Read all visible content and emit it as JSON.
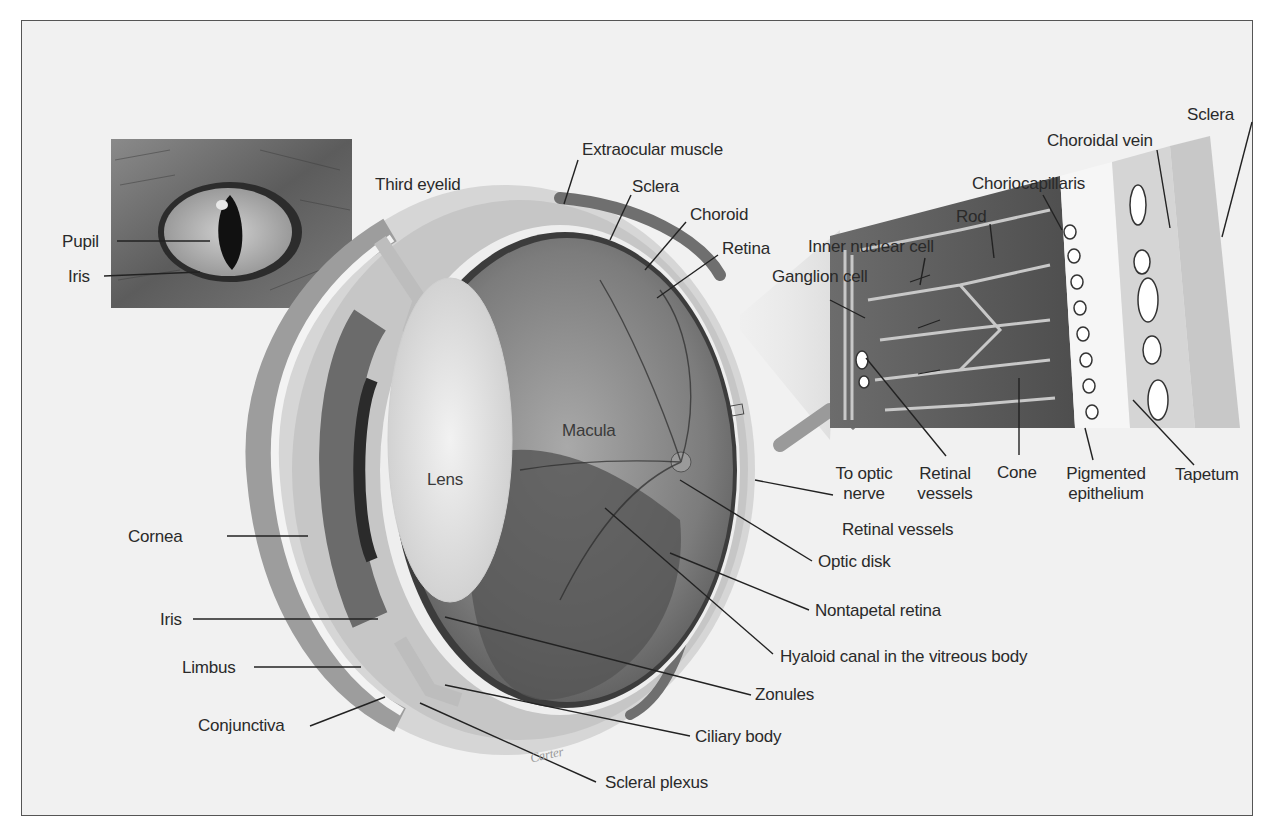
{
  "figure": {
    "inset_photo": {
      "description": "Close-up photograph of a cat eye with slit pupil",
      "labels": [
        "Pupil",
        "Iris"
      ]
    },
    "cross_section": {
      "description": "Cut-away illustration of the eyeball",
      "labels_top": [
        "Third eyelid",
        "Extraocular muscle",
        "Sclera",
        "Choroid",
        "Retina"
      ],
      "labels_interior": [
        "Lens",
        "Macula"
      ],
      "labels_left": [
        "Cornea",
        "Iris",
        "Limbus",
        "Conjunctiva"
      ],
      "labels_right": [
        "Retinal vessels",
        "Optic disk",
        "Nontapetal retina",
        "Hyaloid canal in the vitreous body",
        "Zonules",
        "Ciliary body",
        "Scleral plexus"
      ]
    },
    "retina_detail": {
      "description": "Magnified section of retina, choroid and sclera",
      "labels_top": [
        "Sclera",
        "Choroidal vein",
        "Choriocapillaris",
        "Rod",
        "Inner nuclear cell",
        "Ganglion cell"
      ],
      "labels_bottom": [
        "To optic nerve",
        "Retinal vessels",
        "Cone",
        "Pigmented epithelium",
        "Tapetum"
      ]
    },
    "signature": "Carter"
  },
  "labels": {
    "pupil": "Pupil",
    "iris_photo": "Iris",
    "third_eyelid": "Third eyelid",
    "extraocular_muscle": "Extraocular muscle",
    "sclera": "Sclera",
    "choroid": "Choroid",
    "retina": "Retina",
    "lens": "Lens",
    "macula": "Macula",
    "cornea": "Cornea",
    "iris": "Iris",
    "limbus": "Limbus",
    "conjunctiva": "Conjunctiva",
    "retinal_vessels": "Retinal vessels",
    "optic_disk": "Optic disk",
    "nontapetal_retina": "Nontapetal retina",
    "hyaloid_canal": "Hyaloid canal in the vitreous body",
    "zonules": "Zonules",
    "ciliary_body": "Ciliary body",
    "scleral_plexus": "Scleral plexus",
    "detail_sclera": "Sclera",
    "choroidal_vein": "Choroidal vein",
    "choriocapillaris": "Choriocapillaris",
    "rod": "Rod",
    "inner_nuclear_cell": "Inner nuclear cell",
    "ganglion_cell": "Ganglion cell",
    "to_optic_nerve_1": "To optic",
    "to_optic_nerve_2": "nerve",
    "detail_retinal_vessels_1": "Retinal",
    "detail_retinal_vessels_2": "vessels",
    "cone": "Cone",
    "pigmented_epithelium_1": "Pigmented",
    "pigmented_epithelium_2": "epithelium",
    "tapetum": "Tapetum",
    "signature": "Carter"
  }
}
